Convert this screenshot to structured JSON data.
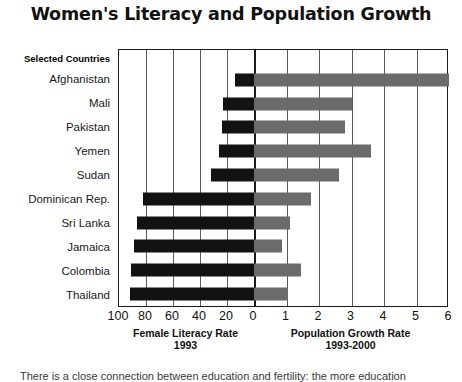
{
  "title": "Women's Literacy and Population Growth",
  "category_header": "Selected Countries",
  "left_axis": {
    "caption": "Female Literacy Rate",
    "period": "1993"
  },
  "right_axis": {
    "caption": "Population Growth Rate",
    "period": "1993-2000"
  },
  "footer_note": "There is a close connection between education and fertility: the more education",
  "colors": {
    "literacy_bar": "#121212",
    "growth_bar": "#6b6b6b",
    "gridline": "#5c5c5c",
    "axis": "#1a1a1a",
    "background": "#ffffff"
  },
  "chart_data": {
    "type": "bar",
    "title": "Women's Literacy and Population Growth",
    "orientation": "horizontal",
    "layout": "diverging-bidirectional",
    "grid": true,
    "legend": "none",
    "categories": [
      "Afghanistan",
      "Mali",
      "Pakistan",
      "Yemen",
      "Sudan",
      "Dominican Rep.",
      "Sri Lanka",
      "Jamaica",
      "Colombia",
      "Thailand"
    ],
    "series": [
      {
        "name": "Female Literacy Rate 1993",
        "side": "left",
        "unit": "percent",
        "axis_label": "Female Literacy Rate",
        "axis_sublabel": "1993",
        "axis_direction": "reversed",
        "axis_range": [
          100,
          0
        ],
        "ticks": [
          100,
          80,
          60,
          40,
          20,
          0
        ],
        "color": "#121212",
        "values": [
          14,
          23,
          24,
          26,
          32,
          82,
          87,
          89,
          91,
          92
        ]
      },
      {
        "name": "Population Growth Rate 1993-2000",
        "side": "right",
        "unit": "percent per year",
        "axis_label": "Population Growth Rate",
        "axis_sublabel": "1993-2000",
        "axis_direction": "normal",
        "axis_range": [
          0,
          6
        ],
        "ticks": [
          0,
          1,
          2,
          3,
          4,
          5,
          6
        ],
        "color": "#6b6b6b",
        "values": [
          6.0,
          3.0,
          2.8,
          3.6,
          2.6,
          1.75,
          1.1,
          0.85,
          1.45,
          1.05
        ]
      }
    ],
    "left_ticks": [
      100,
      80,
      60,
      40,
      20,
      0
    ],
    "right_ticks": [
      1,
      2,
      3,
      4,
      5,
      6
    ]
  }
}
